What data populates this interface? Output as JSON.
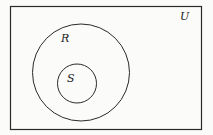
{
  "diagram": {
    "type": "venn",
    "universe": {
      "label": "U",
      "rect": {
        "x": 10,
        "y": 6,
        "width": 191,
        "height": 123
      },
      "label_pos": {
        "x": 180,
        "y": 20
      }
    },
    "sets": [
      {
        "label": "R",
        "circle": {
          "cx": 81,
          "cy": 72.5,
          "r": 48.5
        },
        "label_pos": {
          "x": 61,
          "y": 42
        }
      },
      {
        "label": "S",
        "circle": {
          "cx": 77,
          "cy": 83.5,
          "r": 19.5
        },
        "label_pos": {
          "x": 67,
          "y": 82
        }
      }
    ],
    "relationship": "S is a subset of R, R is a subset of U",
    "stroke_color": "#2a2a2a",
    "background_color": "#fbfbf9"
  }
}
